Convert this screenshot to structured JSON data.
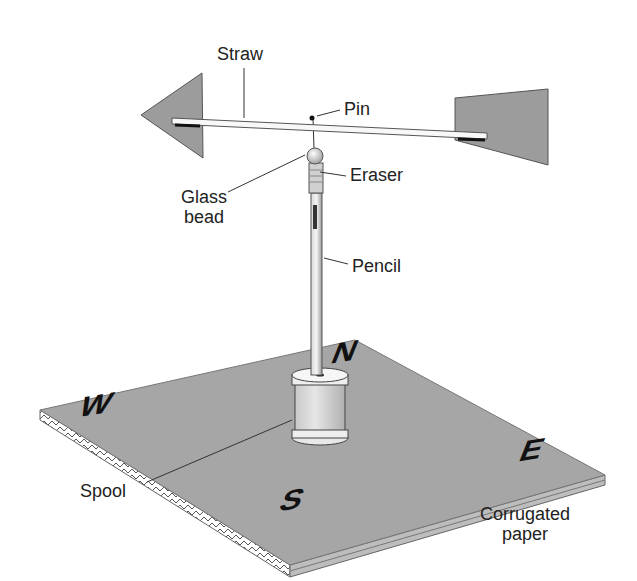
{
  "diagram": {
    "labels": {
      "straw": "Straw",
      "pin": "Pin",
      "eraser": "Eraser",
      "glass_bead_line1": "Glass",
      "glass_bead_line2": "bead",
      "pencil": "Pencil",
      "spool": "Spool",
      "corrugated_line1": "Corrugated",
      "corrugated_line2": "paper"
    },
    "compass": {
      "north": "N",
      "south": "S",
      "east": "E",
      "west": "W"
    },
    "colors": {
      "board": "#a6a6a6",
      "vane_fins": "#9c9c9c",
      "text": "#222222",
      "background": "#ffffff"
    }
  }
}
